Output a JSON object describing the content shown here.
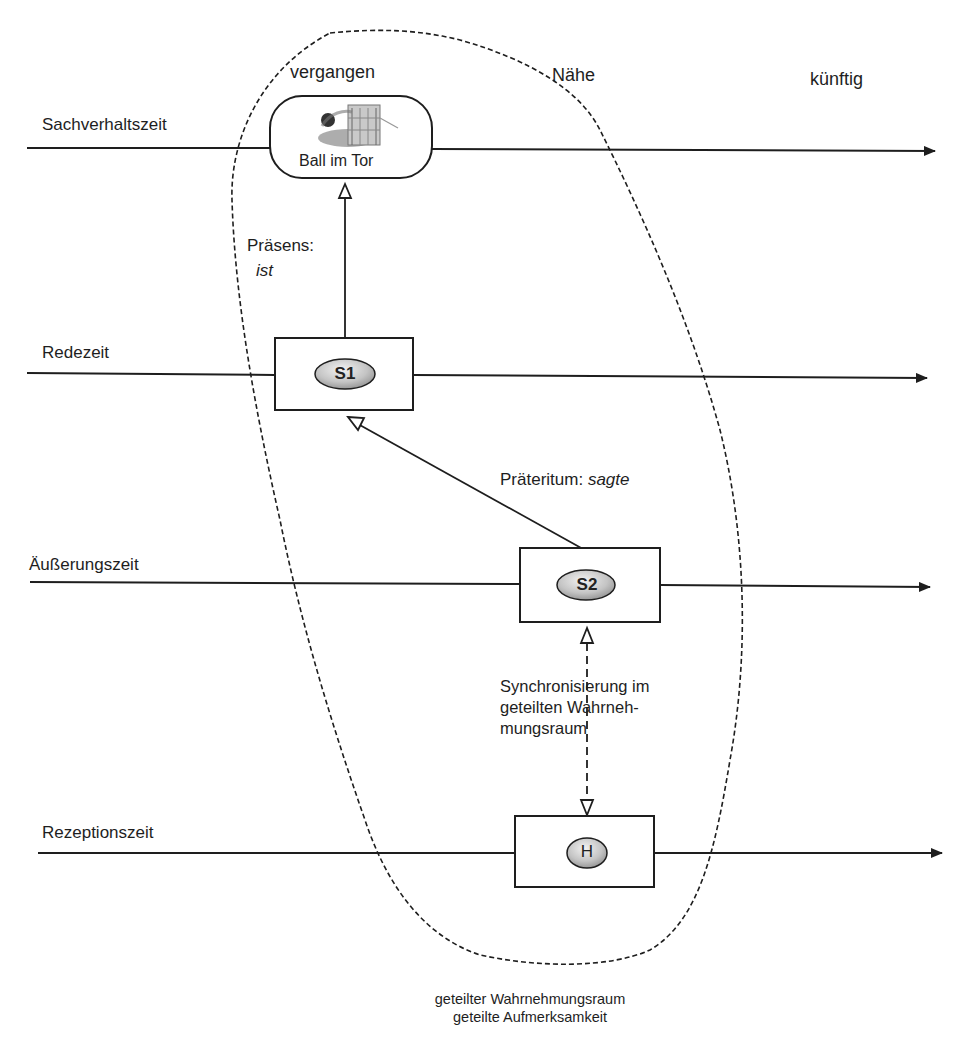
{
  "zones": {
    "past": "vergangen",
    "near": "Nähe",
    "future": "künftig"
  },
  "timelines": [
    {
      "label": "Sachverhaltszeit"
    },
    {
      "label": "Redezeit"
    },
    {
      "label": "Äußerungszeit"
    },
    {
      "label": "Rezeptionszeit"
    }
  ],
  "event": {
    "label": "Ball im Tor",
    "image": "ball-in-goal-icon"
  },
  "nodes": {
    "s1": "S1",
    "s2": "S2",
    "h": "H"
  },
  "relations": {
    "present_label": "Präsens:",
    "present_form": "ist",
    "past_label": "Präteritum:",
    "past_form": "sagte",
    "sync_line1": "Synchronisierung  im",
    "sync_line2": "geteilten Wahrneh-",
    "sync_line3": "mungsraum"
  },
  "caption": {
    "line1": "geteilter Wahrnehmungsraum",
    "line2": "geteilte Aufmerksamkeit"
  },
  "colors": {
    "stroke": "#1e1e1e",
    "oval_fill_light": "#eeeeee",
    "oval_fill_dark": "#9a9a9a",
    "background": "#ffffff"
  }
}
